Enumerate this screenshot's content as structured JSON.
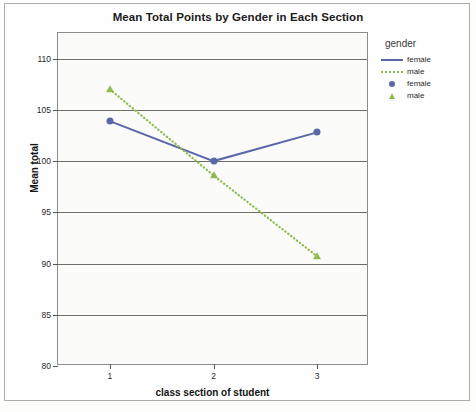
{
  "chart_data": {
    "type": "line",
    "title": "Mean Total Points by Gender in Each Section",
    "xlabel": "class section of student",
    "ylabel": "Mean total",
    "categories": [
      "1",
      "2",
      "3"
    ],
    "xlim": [
      0.5,
      3.5
    ],
    "ylim": [
      80,
      112.5
    ],
    "yticks": [
      80,
      85,
      90,
      95,
      100,
      105,
      110
    ],
    "ytick_labels": [
      "80",
      "85",
      "90",
      "95",
      "100",
      "105",
      "110"
    ],
    "grid": "horizontal",
    "legend_position": "right",
    "legend_title": "gender",
    "series": [
      {
        "name": "female",
        "style": "solid",
        "marker": "circle",
        "color": "#5a67a8",
        "values": [
          103.9,
          100.0,
          102.8
        ]
      },
      {
        "name": "male",
        "style": "dotted",
        "marker": "triangle",
        "color": "#8fbc4f",
        "values": [
          107.0,
          98.6,
          90.7
        ]
      }
    ]
  },
  "legend": {
    "title": "gender",
    "entries": [
      {
        "label": "female",
        "key": "solid-line",
        "color": "#5a67a8"
      },
      {
        "label": "male",
        "key": "dotted-line",
        "color": "#8fbc4f"
      },
      {
        "label": "female",
        "key": "circle-marker",
        "color": "#5a67a8"
      },
      {
        "label": "male",
        "key": "triangle-marker",
        "color": "#8fbc4f"
      }
    ]
  },
  "colors": {
    "female": "#5a67a8",
    "male": "#8fbc4f",
    "gridline": "#6e6e66",
    "plot_border": "#8d8d8d",
    "plot_background": "#fbfbfa",
    "outer_border": "#aeaeae",
    "text": "#1b1b1b"
  }
}
